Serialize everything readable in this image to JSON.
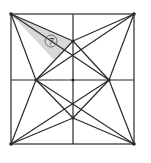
{
  "diagram": {
    "type": "geometric-figure",
    "shaded_region_label": "7",
    "colors": {
      "line": "#2a2a2a",
      "shade": "#d8d8d8",
      "background": "#ffffff"
    }
  }
}
